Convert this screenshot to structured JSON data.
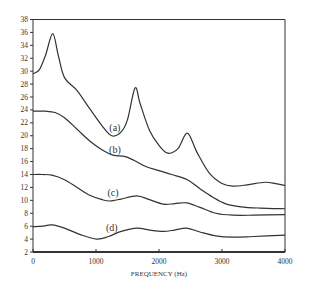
{
  "chart_data": {
    "type": "line",
    "title": "",
    "xlabel": "FREQUENCY (Hz)",
    "ylabel": "",
    "xlim": [
      0,
      4000
    ],
    "ylim": [
      2,
      38
    ],
    "x_ticks": [
      0,
      1000,
      2000,
      3000,
      4000
    ],
    "y_ticks": [
      2,
      4,
      6,
      8,
      10,
      12,
      14,
      16,
      18,
      20,
      22,
      24,
      26,
      28,
      30,
      32,
      34,
      36,
      38
    ],
    "grid": false,
    "legend": "inline labels",
    "series": [
      {
        "name": "(a)",
        "label_pos": [
          1300,
          20.8
        ],
        "x": [
          0,
          100,
          200,
          313,
          400,
          500,
          700,
          900,
          1100,
          1250,
          1400,
          1500,
          1620,
          1700,
          1850,
          2000,
          2140,
          2300,
          2450,
          2600,
          2800,
          3000,
          3170,
          3400,
          3680,
          3850,
          4000
        ],
        "y": [
          29.6,
          30.2,
          32.5,
          35.8,
          32.5,
          29.0,
          27.0,
          24.2,
          21.5,
          20.0,
          20.6,
          22.5,
          27.4,
          25.0,
          20.8,
          18.5,
          17.3,
          18.0,
          20.4,
          17.5,
          14.2,
          12.6,
          12.2,
          12.4,
          12.8,
          12.6,
          12.3
        ]
      },
      {
        "name": "(b)",
        "label_pos": [
          1300,
          17.4
        ],
        "x": [
          0,
          200,
          350,
          500,
          700,
          900,
          1100,
          1270,
          1450,
          1600,
          1800,
          2000,
          2200,
          2450,
          2650,
          2850,
          3050,
          3300,
          3600,
          4000
        ],
        "y": [
          23.8,
          23.8,
          23.6,
          22.8,
          21.0,
          19.2,
          17.8,
          17.0,
          16.8,
          16.2,
          15.2,
          14.6,
          14.0,
          13.2,
          11.8,
          10.5,
          9.5,
          9.0,
          8.8,
          8.7
        ]
      },
      {
        "name": "(c)",
        "label_pos": [
          1270,
          10.6
        ],
        "x": [
          0,
          150,
          300,
          500,
          700,
          900,
          1100,
          1220,
          1400,
          1650,
          1850,
          2070,
          2250,
          2440,
          2650,
          2900,
          3170,
          3500,
          4000
        ],
        "y": [
          14.0,
          14.0,
          13.9,
          13.2,
          12.0,
          10.8,
          10.1,
          9.9,
          10.2,
          10.7,
          10.1,
          9.4,
          9.5,
          9.6,
          8.9,
          8.0,
          7.7,
          7.7,
          7.8
        ]
      },
      {
        "name": "(d)",
        "label_pos": [
          1250,
          5.3
        ],
        "x": [
          0,
          150,
          300,
          500,
          750,
          1010,
          1200,
          1400,
          1650,
          1850,
          2070,
          2250,
          2440,
          2650,
          2900,
          3170,
          3500,
          4000
        ],
        "y": [
          5.9,
          6.0,
          6.2,
          5.7,
          4.7,
          4.0,
          4.4,
          5.2,
          5.7,
          5.4,
          5.2,
          5.4,
          5.7,
          5.1,
          4.5,
          4.3,
          4.4,
          4.6
        ]
      }
    ]
  },
  "layout": {
    "plot_left": 33,
    "plot_right": 285,
    "plot_top": 19.5,
    "plot_bottom": 252,
    "line_color": "#333333",
    "axis_color": "#333333"
  }
}
